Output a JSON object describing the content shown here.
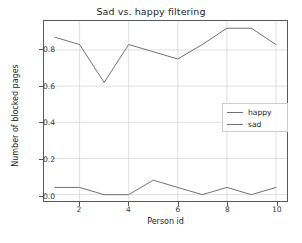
{
  "chart_data": {
    "type": "line",
    "title": "Sad vs. happy filtering",
    "xlabel": "Person id",
    "ylabel": "Number of blocked pages",
    "x": [
      1,
      2,
      3,
      4,
      5,
      6,
      7,
      8,
      9,
      10
    ],
    "series": [
      {
        "name": "happy",
        "color": "#707070",
        "values": [
          0.04,
          0.04,
          0.0,
          0.0,
          0.08,
          0.04,
          0.0,
          0.04,
          0.0,
          0.04
        ]
      },
      {
        "name": "sad",
        "color": "#707070",
        "values": [
          0.87,
          0.83,
          0.62,
          0.83,
          0.79,
          0.75,
          0.83,
          0.92,
          0.92,
          0.83
        ]
      }
    ],
    "xlim": [
      0.55,
      10.45
    ],
    "ylim": [
      -0.035,
      0.96
    ],
    "xticks": [
      2,
      4,
      6,
      8,
      10
    ],
    "xtick_labels": [
      "2",
      "4",
      "6",
      "8",
      "10"
    ],
    "yticks": [
      0.0,
      0.2,
      0.4,
      0.6,
      0.8
    ],
    "ytick_labels": [
      "0.0",
      "0.2",
      "0.4",
      "0.6",
      "0.8"
    ],
    "grid": true,
    "grid_color": "#d6d8db",
    "legend_position": "upper right",
    "legend_entries": [
      "happy",
      "sad"
    ],
    "axes_color": "#555a60",
    "background": "#ffffff"
  }
}
